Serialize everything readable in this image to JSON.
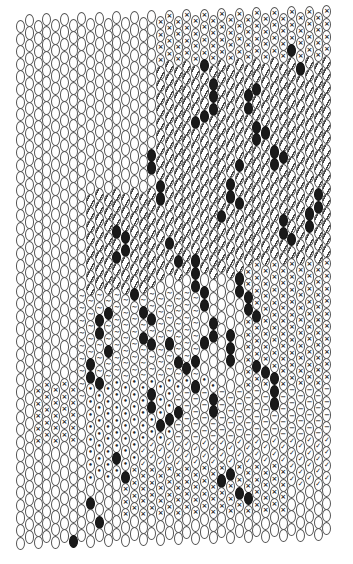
{
  "chart_data": {
    "type": "bead-pattern",
    "title": "",
    "stitch": "peyote",
    "columns": 36,
    "rows": 42,
    "legend": {
      "plain": "empty oval bead",
      "x": "×",
      "slash": "/",
      "tilde": "~",
      "check": "✓",
      "dot": "•",
      "dash": "−",
      "black": "filled black bead"
    },
    "colors": {
      "outline": "#555555",
      "black_bead": "#1a1a1a",
      "background": "#ffffff"
    },
    "regions": [
      {
        "symbol": "x",
        "cols": [
          25,
          35
        ],
        "rows": [
          0,
          6
        ]
      },
      {
        "symbol": "x",
        "cols": [
          16,
          24
        ],
        "rows": [
          0,
          3
        ]
      },
      {
        "symbol": "slash",
        "cols": [
          16,
          35
        ],
        "rows": [
          4,
          20
        ]
      },
      {
        "symbol": "slash",
        "cols": [
          8,
          15
        ],
        "rows": [
          14,
          26
        ]
      },
      {
        "symbol": "tilde",
        "cols": [
          7,
          20
        ],
        "rows": [
          22,
          30
        ]
      },
      {
        "symbol": "x",
        "cols": [
          26,
          35
        ],
        "rows": [
          20,
          32
        ]
      },
      {
        "symbol": "dot",
        "cols": [
          8,
          22
        ],
        "rows": [
          29,
          36
        ]
      },
      {
        "symbol": "dash",
        "cols": [
          18,
          35
        ],
        "rows": [
          30,
          34
        ]
      },
      {
        "symbol": "check",
        "cols": [
          14,
          35
        ],
        "rows": [
          34,
          37
        ]
      },
      {
        "symbol": "x",
        "cols": [
          2,
          6
        ],
        "rows": [
          29,
          33
        ]
      },
      {
        "symbol": "x",
        "cols": [
          12,
          30
        ],
        "rows": [
          36,
          39
        ]
      }
    ],
    "black_beads": [
      [
        21,
        4
      ],
      [
        22,
        5
      ],
      [
        22,
        6
      ],
      [
        22,
        7
      ],
      [
        21,
        8
      ],
      [
        20,
        8
      ],
      [
        26,
        6
      ],
      [
        26,
        7
      ],
      [
        27,
        6
      ],
      [
        27,
        9
      ],
      [
        27,
        10
      ],
      [
        28,
        9
      ],
      [
        31,
        3
      ],
      [
        32,
        4
      ],
      [
        34,
        14
      ],
      [
        34,
        15
      ],
      [
        33,
        16
      ],
      [
        33,
        17
      ],
      [
        15,
        11
      ],
      [
        15,
        12
      ],
      [
        16,
        13
      ],
      [
        16,
        14
      ],
      [
        24,
        13
      ],
      [
        24,
        14
      ],
      [
        25,
        12
      ],
      [
        25,
        15
      ],
      [
        23,
        16
      ],
      [
        29,
        11
      ],
      [
        29,
        12
      ],
      [
        30,
        11
      ],
      [
        30,
        16
      ],
      [
        30,
        17
      ],
      [
        31,
        18
      ],
      [
        17,
        18
      ],
      [
        18,
        19
      ],
      [
        20,
        19
      ],
      [
        20,
        20
      ],
      [
        26,
        22
      ],
      [
        26,
        23
      ],
      [
        27,
        24
      ],
      [
        11,
        17
      ],
      [
        12,
        17
      ],
      [
        12,
        18
      ],
      [
        11,
        19
      ],
      [
        13,
        22
      ],
      [
        14,
        23
      ],
      [
        15,
        24
      ],
      [
        14,
        25
      ],
      [
        15,
        26
      ],
      [
        9,
        24
      ],
      [
        9,
        25
      ],
      [
        10,
        23
      ],
      [
        10,
        26
      ],
      [
        8,
        27
      ],
      [
        8,
        28
      ],
      [
        9,
        29
      ],
      [
        20,
        21
      ],
      [
        21,
        22
      ],
      [
        21,
        23
      ],
      [
        22,
        24
      ],
      [
        22,
        25
      ],
      [
        21,
        26
      ],
      [
        20,
        27
      ],
      [
        25,
        21
      ],
      [
        25,
        22
      ],
      [
        24,
        25
      ],
      [
        24,
        26
      ],
      [
        24,
        27
      ],
      [
        17,
        26
      ],
      [
        18,
        27
      ],
      [
        19,
        28
      ],
      [
        20,
        29
      ],
      [
        22,
        30
      ],
      [
        22,
        31
      ],
      [
        27,
        28
      ],
      [
        28,
        28
      ],
      [
        29,
        29
      ],
      [
        29,
        30
      ],
      [
        29,
        31
      ],
      [
        15,
        30
      ],
      [
        15,
        31
      ],
      [
        16,
        32
      ],
      [
        17,
        32
      ],
      [
        18,
        31
      ],
      [
        11,
        35
      ],
      [
        12,
        36
      ],
      [
        23,
        37
      ],
      [
        24,
        36
      ],
      [
        25,
        38
      ],
      [
        26,
        38
      ],
      [
        8,
        38
      ],
      [
        9,
        40
      ],
      [
        6,
        41
      ]
    ]
  }
}
